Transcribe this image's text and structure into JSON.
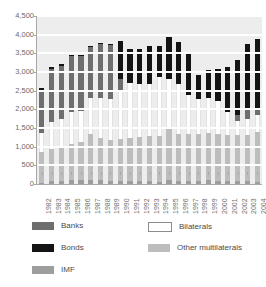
{
  "top_caption": "",
  "colors": {
    "banks": "#6e6e6e",
    "bonds": "#141414",
    "imf": "#9d9d9d",
    "bilaterals": "#ffffff",
    "other_multilaterals": "#bdbdbd",
    "plot_background": "#ededed",
    "gridline": "#ffffff",
    "axis": "#a8a8a8",
    "tick_text": "#6b6b6b"
  },
  "legend": {
    "items": [
      {
        "key": "banks",
        "label": "Banks",
        "color": "#6e6e6e",
        "bordered": false
      },
      {
        "key": "bilaterals",
        "label": "Bilaterals",
        "color": "#ffffff",
        "bordered": true
      },
      {
        "key": "bonds",
        "label": "Bonds",
        "color": "#141414",
        "bordered": false
      },
      {
        "key": "other_multilaterals",
        "label": "Other multilaterals",
        "color": "#bdbdbd",
        "bordered": false
      },
      {
        "key": "imf",
        "label": "IMF",
        "color": "#9d9d9d",
        "bordered": false
      }
    ]
  },
  "chart_data": {
    "type": "bar",
    "stacked": true,
    "title": "",
    "xlabel": "",
    "ylabel": "",
    "ylim": [
      0,
      4500
    ],
    "ytick_step": 500,
    "ytick_labels": [
      "4,500",
      "4,000",
      "3,500",
      "3,000",
      "2,500",
      "2,000",
      "1,500",
      "1,000",
      "500",
      "0"
    ],
    "ytick_values": [
      4500,
      4000,
      3500,
      3000,
      2500,
      2000,
      1500,
      1000,
      500,
      0
    ],
    "grid": true,
    "legend_position": "bottom",
    "categories": [
      "1982",
      "1983",
      "1984",
      "1985",
      "1986",
      "1987",
      "1988",
      "1989",
      "1990",
      "1991",
      "1992",
      "1993",
      "1994",
      "1995",
      "1996",
      "1997",
      "1998",
      "1999",
      "2000",
      "2001",
      "2002",
      "2003",
      "2004"
    ],
    "stack_order": [
      "imf",
      "other_multilaterals",
      "bilaterals",
      "banks",
      "bonds"
    ],
    "series": [
      {
        "name": "IMF",
        "key": "imf",
        "values": [
          30,
          70,
          90,
          110,
          120,
          100,
          95,
          90,
          85,
          80,
          75,
          70,
          65,
          110,
          80,
          75,
          90,
          95,
          90,
          85,
          80,
          75,
          60
        ]
      },
      {
        "name": "Other multilaterals",
        "key": "other_multilaterals",
        "values": [
          830,
          880,
          930,
          960,
          1000,
          1230,
          1130,
          1100,
          1110,
          1150,
          1190,
          1210,
          1230,
          1370,
          1250,
          1260,
          1260,
          1270,
          1250,
          1240,
          1230,
          1250,
          1340
        ]
      },
      {
        "name": "Bilaterals",
        "key": "bilaterals",
        "values": [
          510,
          720,
          710,
          860,
          830,
          970,
          1080,
          1080,
          1300,
          1470,
          1420,
          1390,
          1570,
          1340,
          1350,
          1060,
          920,
          930,
          880,
          600,
          390,
          420,
          440
        ]
      },
      {
        "name": "Banks",
        "key": "banks",
        "values": [
          1110,
          1420,
          1420,
          1500,
          1480,
          1380,
          1450,
          1460,
          330,
          0,
          0,
          0,
          0,
          0,
          0,
          0,
          0,
          0,
          0,
          0,
          140,
          250,
          200
        ]
      },
      {
        "name": "Bonds",
        "key": "bonds",
        "values": [
          80,
          50,
          70,
          30,
          30,
          30,
          30,
          30,
          1010,
          920,
          940,
          1020,
          820,
          1120,
          1120,
          1100,
          640,
          760,
          870,
          1220,
          1490,
          1760,
          1840
        ]
      }
    ],
    "totals": [
      2560,
      3140,
      3220,
      3460,
      3460,
      3710,
      3785,
      3760,
      2835,
      2620,
      2625,
      2690,
      2685,
      3940,
      3800,
      3495,
      2910,
      3055,
      3090,
      3145,
      3330,
      3755,
      3880
    ]
  }
}
